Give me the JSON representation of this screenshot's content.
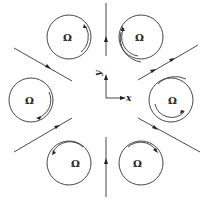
{
  "diagram": {
    "stroke_color": "#333333",
    "background": "#ffffff",
    "axes": {
      "x_label": "x",
      "y_label": "y",
      "origin": [
        106,
        98
      ]
    },
    "rollers": [
      {
        "id": "top-left",
        "label": "Ω",
        "cx": 69,
        "cy": 37,
        "r": 22,
        "rotation": "clockwise-arc-right"
      },
      {
        "id": "top-right",
        "label": "Ω",
        "cx": 141,
        "cy": 37,
        "r": 22,
        "rotation": "counterclockwise-arc-left"
      },
      {
        "id": "left",
        "label": "Ω",
        "cx": 31,
        "cy": 100,
        "r": 22,
        "rotation": "clockwise-arc-lower-right"
      },
      {
        "id": "right",
        "label": "Ω",
        "cx": 171,
        "cy": 100,
        "r": 22,
        "rotation": "arc-lower-left"
      },
      {
        "id": "bottom-left",
        "label": "Ω",
        "cx": 69,
        "cy": 163,
        "r": 22,
        "rotation": "arc-top-pointing-left"
      },
      {
        "id": "bottom-right",
        "label": "Ω",
        "cx": 141,
        "cy": 163,
        "r": 22,
        "rotation": "arc-top-pointing-right"
      }
    ],
    "streamlines": [
      {
        "id": "vertical-top",
        "from": [
          106,
          3
        ],
        "to": [
          106,
          56
        ],
        "arrow_direction": "up"
      },
      {
        "id": "vertical-bottom",
        "from": [
          106,
          137
        ],
        "to": [
          106,
          197
        ],
        "arrow_direction": "up"
      },
      {
        "id": "upper-left",
        "from": [
          14,
          48
        ],
        "to": [
          72,
          81
        ],
        "arrow_direction": "down-right"
      },
      {
        "id": "upper-right",
        "from": [
          138,
          80
        ],
        "to": [
          198,
          45
        ],
        "arrow_direction": "up-right"
      },
      {
        "id": "lower-left",
        "from": [
          14,
          152
        ],
        "to": [
          72,
          118
        ],
        "arrow_direction": "up-right"
      },
      {
        "id": "lower-right",
        "from": [
          138,
          118
        ],
        "to": [
          200,
          152
        ],
        "arrow_direction": "down-right"
      }
    ]
  }
}
